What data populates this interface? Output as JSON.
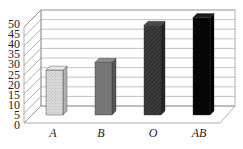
{
  "chart_data": {
    "type": "bar",
    "title": "",
    "xlabel": "",
    "ylabel": "",
    "style": "3d-column",
    "categories": [
      "A",
      "B",
      "O",
      "AB"
    ],
    "values": [
      23,
      27,
      46,
      50
    ],
    "ylim": [
      0,
      50
    ],
    "yticks": [
      "0",
      "5",
      "10",
      "15",
      "20",
      "25",
      "30",
      "35",
      "40",
      "45",
      "50"
    ],
    "grid": true,
    "legend": "none",
    "bar_colors": {
      "A": {
        "front": "#d6d6d6",
        "side": "#b2b2b2",
        "top": "#e6e6e6"
      },
      "B": {
        "front": "#767676",
        "side": "#555555",
        "top": "#8c8c8c"
      },
      "O": {
        "front": "#3a3a3a",
        "side": "#242424",
        "top": "#4a4a4a"
      },
      "AB": {
        "front": "#050505",
        "side": "#000000",
        "top": "#1a1a1a"
      }
    }
  }
}
